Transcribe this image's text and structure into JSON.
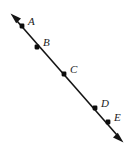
{
  "figure": {
    "type": "geometry-line-diagram",
    "canvas": {
      "width": 132,
      "height": 152,
      "background": "#ffffff"
    },
    "line": {
      "name": "double-headed-ray",
      "color": "#141414",
      "stroke_width": 1.6,
      "start": {
        "x": 11,
        "y": 14
      },
      "end": {
        "x": 123,
        "y": 142
      },
      "arrowheads": [
        "start",
        "end"
      ]
    },
    "points": [
      {
        "id": "A",
        "label": "A",
        "x": 22,
        "y": 26,
        "label_x": 28,
        "label_y": 25
      },
      {
        "id": "B",
        "label": "B",
        "x": 37,
        "y": 47,
        "label_x": 43,
        "label_y": 46
      },
      {
        "id": "C",
        "label": "C",
        "x": 64,
        "y": 74,
        "label_x": 70,
        "label_y": 73
      },
      {
        "id": "D",
        "label": "D",
        "x": 95,
        "y": 108,
        "label_x": 101,
        "label_y": 107
      },
      {
        "id": "E",
        "label": "E",
        "x": 108,
        "y": 122,
        "label_x": 114,
        "label_y": 121
      }
    ],
    "labels": {
      "a": "A",
      "b": "B",
      "c": "C",
      "d": "D",
      "e": "E"
    }
  }
}
